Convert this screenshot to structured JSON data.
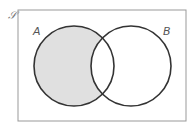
{
  "diagram": {
    "type": "venn",
    "universal_set_label": "𝒮",
    "sets": [
      {
        "label": "A",
        "shaded_region": "A only (A minus B)"
      },
      {
        "label": "B"
      }
    ],
    "colors": {
      "shade": "#e0e0e0",
      "stroke": "#333333",
      "frame": "#888888"
    }
  }
}
